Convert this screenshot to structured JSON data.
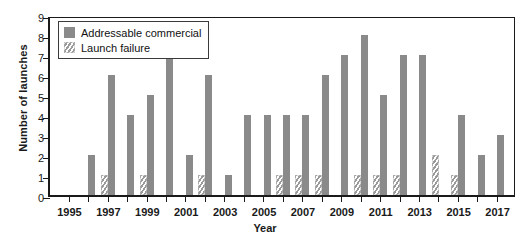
{
  "chart_data": {
    "type": "bar",
    "title": "",
    "xlabel": "Year",
    "ylabel": "Number of launches",
    "grid": false,
    "legend_position": "top-left",
    "ylim": [
      0,
      9
    ],
    "yticks": [
      0,
      1,
      2,
      3,
      4,
      5,
      6,
      7,
      8,
      9
    ],
    "xlim": [
      1995,
      2017
    ],
    "xticks": [
      1995,
      1997,
      1999,
      2001,
      2003,
      2005,
      2007,
      2009,
      2011,
      2013,
      2015,
      2017
    ],
    "categories": [
      1995,
      1996,
      1997,
      1998,
      1999,
      2000,
      2001,
      2002,
      2003,
      2004,
      2005,
      2006,
      2007,
      2008,
      2009,
      2010,
      2011,
      2012,
      2013,
      2014,
      2015,
      2016,
      2017
    ],
    "series": [
      {
        "name": "Addressable commercial",
        "color": "#8a8a8a",
        "pattern": "solid",
        "values": [
          0,
          2,
          6,
          4,
          5,
          7,
          2,
          6,
          1,
          4,
          4,
          4,
          4,
          6,
          7,
          8,
          5,
          7,
          7,
          0,
          4,
          2,
          3
        ]
      },
      {
        "name": "Launch failure",
        "color": "#9a9a9a",
        "pattern": "hatched",
        "values": [
          0,
          0,
          1,
          0,
          1,
          0,
          0,
          1,
          0,
          0,
          0,
          1,
          1,
          1,
          0,
          1,
          1,
          1,
          0,
          2,
          1,
          0,
          0
        ]
      }
    ]
  },
  "legend": {
    "items": [
      {
        "label": "Addressable commercial",
        "pattern": "solid"
      },
      {
        "label": "Launch failure",
        "pattern": "hatched"
      }
    ]
  }
}
